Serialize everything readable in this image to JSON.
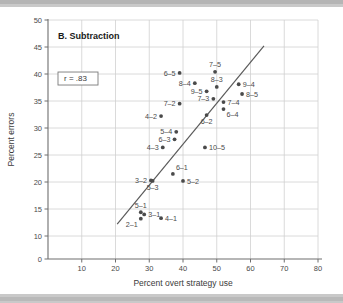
{
  "chart_data": {
    "type": "scatter",
    "title": "B. Subtraction",
    "xlabel": "Percent overt strategy use",
    "ylabel": "Percent errors",
    "xlim": [
      0,
      80
    ],
    "ylim": [
      0,
      50
    ],
    "xticks": [
      10,
      20,
      30,
      40,
      50,
      60,
      70,
      80
    ],
    "yticks": [
      0,
      10,
      15,
      20,
      25,
      30,
      35,
      40,
      45,
      50
    ],
    "grid": true,
    "legend": "none",
    "annotation": "r = .83",
    "correlation": 0.83,
    "regression_line": {
      "x1": 20.5,
      "y1": 12.2,
      "x2": 64.0,
      "y2": 45.2
    },
    "points": [
      {
        "label": "6-5",
        "x": 39.0,
        "y": 40.2,
        "label_side": "left"
      },
      {
        "label": "7-5",
        "x": 49.5,
        "y": 40.4,
        "label_side": "above"
      },
      {
        "label": "8-4",
        "x": 43.5,
        "y": 38.3,
        "label_side": "left"
      },
      {
        "label": "8-3",
        "x": 50.0,
        "y": 37.6,
        "label_side": "above"
      },
      {
        "label": "9-4",
        "x": 56.5,
        "y": 38.1,
        "label_side": "right"
      },
      {
        "label": "9-5",
        "x": 47.0,
        "y": 36.8,
        "label_side": "left"
      },
      {
        "label": "8-5",
        "x": 57.5,
        "y": 36.3,
        "label_side": "right"
      },
      {
        "label": "7-3",
        "x": 49.0,
        "y": 35.4,
        "label_side": "left"
      },
      {
        "label": "7-4",
        "x": 52.0,
        "y": 34.8,
        "label_side": "right"
      },
      {
        "label": "7-2",
        "x": 39.0,
        "y": 34.5,
        "label_side": "left"
      },
      {
        "label": "6-4",
        "x": 52.0,
        "y": 33.5,
        "label_side": "below-right"
      },
      {
        "label": "4-2",
        "x": 33.5,
        "y": 32.2,
        "label_side": "left"
      },
      {
        "label": "6-2",
        "x": 47.0,
        "y": 32.4,
        "label_side": "below"
      },
      {
        "label": "5-4",
        "x": 38.0,
        "y": 29.3,
        "label_side": "left"
      },
      {
        "label": "6-3",
        "x": 37.5,
        "y": 27.9,
        "label_side": "left"
      },
      {
        "label": "4-3",
        "x": 34.0,
        "y": 26.4,
        "label_side": "left"
      },
      {
        "label": "10-5",
        "x": 46.5,
        "y": 26.4,
        "label_side": "right"
      },
      {
        "label": "6-1",
        "x": 37.0,
        "y": 21.5,
        "label_side": "above-right"
      },
      {
        "label": "3-2",
        "x": 30.5,
        "y": 20.3,
        "label_side": "left"
      },
      {
        "label": "5-3",
        "x": 31.0,
        "y": 20.2,
        "label_side": "below"
      },
      {
        "label": "5-2",
        "x": 40.0,
        "y": 20.2,
        "label_side": "right"
      },
      {
        "label": "5-1",
        "x": 27.5,
        "y": 14.4,
        "label_side": "above"
      },
      {
        "label": "3-1",
        "x": 28.5,
        "y": 14.0,
        "label_side": "right"
      },
      {
        "label": "2-1",
        "x": 27.5,
        "y": 13.2,
        "label_side": "below-left"
      },
      {
        "label": "4-1",
        "x": 33.5,
        "y": 13.3,
        "label_side": "right"
      }
    ]
  }
}
